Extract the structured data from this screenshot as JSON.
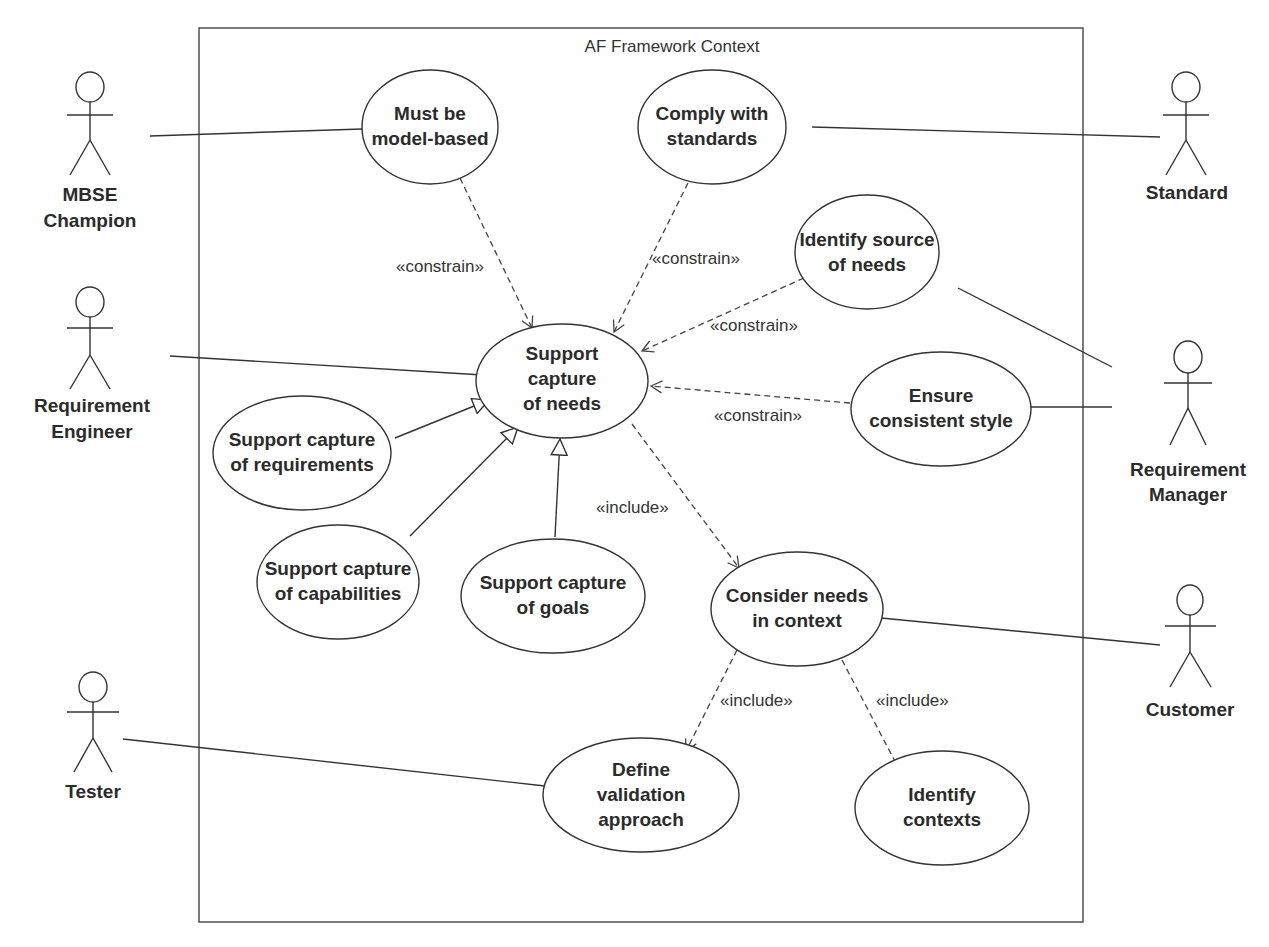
{
  "frame": {
    "title": "AF Framework Context"
  },
  "actors": [
    {
      "id": "mbse",
      "lines": [
        "MBSE",
        "Champion"
      ]
    },
    {
      "id": "req-eng",
      "lines": [
        "Requirement",
        "Engineer"
      ]
    },
    {
      "id": "tester",
      "lines": [
        "Tester"
      ]
    },
    {
      "id": "standard",
      "lines": [
        "Standard"
      ]
    },
    {
      "id": "req-mgr",
      "lines": [
        "Requirement",
        "Manager"
      ]
    },
    {
      "id": "customer",
      "lines": [
        "Customer"
      ]
    }
  ],
  "use_cases": [
    {
      "id": "model-based",
      "lines": [
        "Must be",
        "model-based"
      ]
    },
    {
      "id": "comply",
      "lines": [
        "Comply with",
        "standards"
      ]
    },
    {
      "id": "identify-source",
      "lines": [
        "Identify source",
        "of needs"
      ]
    },
    {
      "id": "support-needs",
      "lines": [
        "Support",
        "capture",
        "of needs"
      ]
    },
    {
      "id": "ensure-style",
      "lines": [
        "Ensure",
        "consistent style"
      ]
    },
    {
      "id": "support-req",
      "lines": [
        "Support capture",
        "of requirements"
      ]
    },
    {
      "id": "support-cap",
      "lines": [
        "Support capture",
        "of capabilities"
      ]
    },
    {
      "id": "support-goals",
      "lines": [
        "Support capture",
        "of goals"
      ]
    },
    {
      "id": "consider",
      "lines": [
        "Consider needs",
        "in context"
      ]
    },
    {
      "id": "define-val",
      "lines": [
        "Define",
        "validation",
        "approach"
      ]
    },
    {
      "id": "identify-ctx",
      "lines": [
        "Identify",
        "contexts"
      ]
    }
  ],
  "relationship_labels": {
    "constrain_1": "«constrain»",
    "constrain_2": "«constrain»",
    "constrain_3": "«constrain»",
    "constrain_4": "«constrain»",
    "include_1": "«include»",
    "include_2": "«include»",
    "include_3": "«include»"
  }
}
